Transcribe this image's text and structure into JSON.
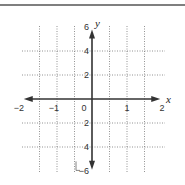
{
  "chart_data": {
    "type": "line",
    "title": "",
    "xlabel": "x",
    "ylabel": "y",
    "xlim": [
      -2,
      2
    ],
    "ylim": [
      -6,
      6
    ],
    "grid": true,
    "grid_style": "dotted",
    "x_gridlines": [
      -1.5,
      -1,
      -0.5,
      0.5,
      1,
      1.5
    ],
    "y_gridlines": [
      -4,
      -2,
      2,
      4
    ],
    "x_ticks": [
      {
        "value": -2,
        "label": "−2"
      },
      {
        "value": -1,
        "label": "−1"
      },
      {
        "value": 0,
        "label": "0"
      },
      {
        "value": 1,
        "label": "1"
      },
      {
        "value": 2,
        "label": "2"
      }
    ],
    "y_ticks": [
      {
        "value": 6,
        "label": "6"
      },
      {
        "value": 4,
        "label": "4"
      },
      {
        "value": 2,
        "label": "2"
      },
      {
        "value": -2,
        "label": "2"
      },
      {
        "value": -4,
        "label": "4"
      },
      {
        "value": -6,
        "label": "−6"
      }
    ],
    "series": [],
    "axes_arrows": true
  },
  "colors": {
    "axis": "#333333",
    "grid": "#777777",
    "border": "#444444"
  }
}
